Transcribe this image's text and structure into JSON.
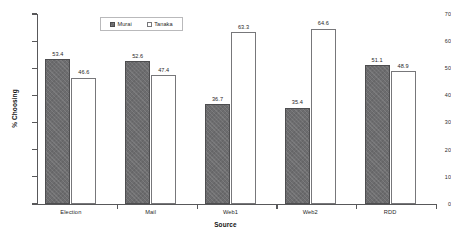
{
  "chart_data": {
    "type": "bar",
    "title": "",
    "xlabel": "Source",
    "ylabel": "% Choosing",
    "categories": [
      "Election",
      "Mail",
      "Web1",
      "Web2",
      "RDD"
    ],
    "series": [
      {
        "name": "Murai",
        "values": [
          53.4,
          52.6,
          36.7,
          35.4,
          51.1
        ]
      },
      {
        "name": "Tanaka",
        "values": [
          46.6,
          47.4,
          63.3,
          64.6,
          48.9
        ]
      }
    ],
    "ylim": [
      0,
      70
    ],
    "yticks": [
      0,
      10,
      20,
      30,
      40,
      50,
      60,
      70
    ],
    "ytick_labels": [
      "0",
      "10",
      "20",
      "30",
      "40",
      "50",
      "60",
      "70"
    ],
    "grid": false,
    "legend_position": "top-center",
    "data_labels": true,
    "colors": {
      "murai": "#6d6d6f",
      "tanaka": "#ffffff",
      "tanaka_border": "#77777a",
      "axis": "#58585a",
      "text": "#1f1f1f",
      "background": "#ffffff"
    }
  }
}
